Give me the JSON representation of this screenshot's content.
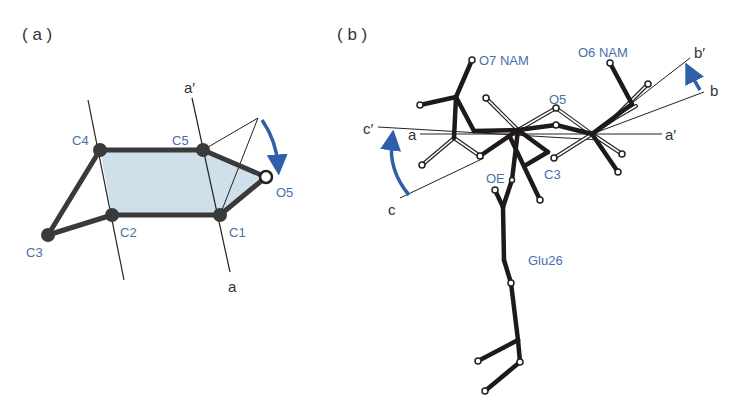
{
  "colors": {
    "atom_label": "#4a6fa8",
    "arrow": "#2f5fa8",
    "ring_fill": "#cfe0ea",
    "bond": "#3a3a3a",
    "line": "#222222",
    "text": "#333333"
  },
  "panel_a": {
    "label": "( a )",
    "atoms": {
      "C1": "C1",
      "C2": "C2",
      "C3": "C3",
      "C4": "C4",
      "C5": "C5",
      "O5": "O5"
    },
    "axis": {
      "top": "a′",
      "bottom": "a"
    }
  },
  "panel_b": {
    "label": "( b )",
    "atom_labels": {
      "o7": "O7 NAM",
      "o6": "O6 NAM",
      "o5": "O5",
      "c3": "C3",
      "oe": "OE",
      "residue": "Glu26"
    },
    "axis_labels": {
      "a_left": "a",
      "a_right": "a′",
      "b": "b",
      "b_prime": "b′",
      "c": "c",
      "c_prime": "c′"
    }
  }
}
